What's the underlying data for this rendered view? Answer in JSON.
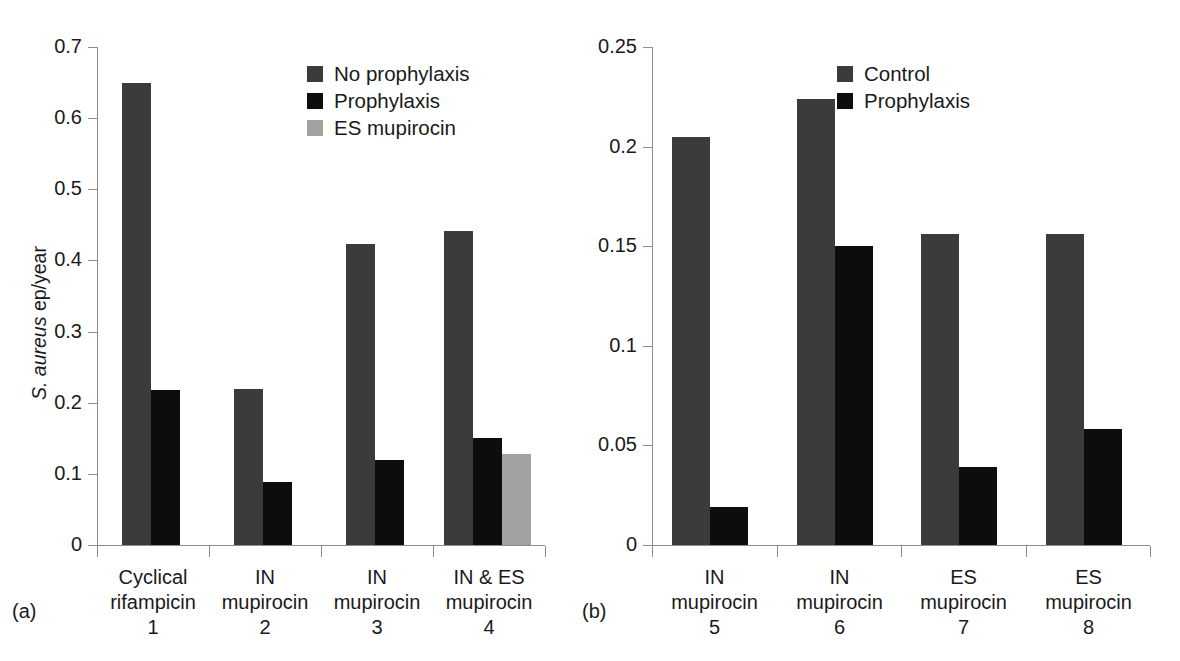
{
  "figure": {
    "colors": {
      "dark_gray": "#3b3b3b",
      "black": "#0d0d0d",
      "light_gray": "#a2a2a2",
      "axis": "#8d8d8d",
      "text": "#1a1a1a",
      "background": "#ffffff"
    },
    "y_axis_title_italic": "S. aureus",
    "y_axis_title_rest": " ep/year",
    "panel_a_tag": "(a)",
    "panel_b_tag": "(b)"
  },
  "chart_data": [
    {
      "type": "bar",
      "panel": "(a)",
      "title": "",
      "xlabel": "",
      "ylabel": "S. aureus ep/year",
      "ylim": [
        0,
        0.7
      ],
      "yticks": [
        "0",
        "0.1",
        "0.2",
        "0.3",
        "0.4",
        "0.5",
        "0.6",
        "0.7"
      ],
      "ytick_values": [
        0,
        0.1,
        0.2,
        0.3,
        0.4,
        0.5,
        0.6,
        0.7
      ],
      "grid": false,
      "legend_position": "top-right",
      "categories": [
        {
          "line1": "Cyclical",
          "line2": "rifampicin",
          "num": "1"
        },
        {
          "line1": "IN",
          "line2": "mupirocin",
          "num": "2"
        },
        {
          "line1": "IN",
          "line2": "mupirocin",
          "num": "3"
        },
        {
          "line1": "IN & ES",
          "line2": "mupirocin",
          "num": "4"
        }
      ],
      "series": [
        {
          "name": "No prophylaxis",
          "color": "#3b3b3b",
          "values": [
            0.649,
            0.219,
            0.423,
            0.441
          ]
        },
        {
          "name": "Prophylaxis",
          "color": "#0d0d0d",
          "values": [
            0.218,
            0.088,
            0.119,
            0.151
          ]
        },
        {
          "name": "ES mupirocin",
          "color": "#a2a2a2",
          "values": [
            null,
            null,
            null,
            0.128
          ]
        }
      ]
    },
    {
      "type": "bar",
      "panel": "(b)",
      "title": "",
      "xlabel": "",
      "ylabel": "",
      "ylim": [
        0,
        0.25
      ],
      "yticks": [
        "0",
        "0.05",
        "0.1",
        "0.15",
        "0.2",
        "0.25"
      ],
      "ytick_values": [
        0,
        0.05,
        0.1,
        0.15,
        0.2,
        0.25
      ],
      "grid": false,
      "legend_position": "top-right",
      "categories": [
        {
          "line1": "IN",
          "line2": "mupirocin",
          "num": "5"
        },
        {
          "line1": "IN",
          "line2": "mupirocin",
          "num": "6"
        },
        {
          "line1": "ES",
          "line2": "mupirocin",
          "num": "7"
        },
        {
          "line1": "ES",
          "line2": "mupirocin",
          "num": "8"
        }
      ],
      "series": [
        {
          "name": "Control",
          "color": "#3b3b3b",
          "values": [
            0.205,
            0.224,
            0.156,
            0.156
          ]
        },
        {
          "name": "Prophylaxis",
          "color": "#0d0d0d",
          "values": [
            0.019,
            0.15,
            0.039,
            0.058
          ]
        }
      ]
    }
  ]
}
